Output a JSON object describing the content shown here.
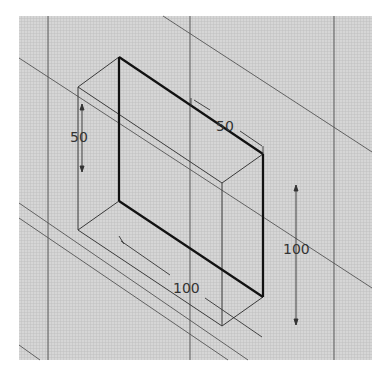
{
  "drawing": {
    "background": "#ffffff",
    "grid_area": {
      "x": 19,
      "y": 16,
      "width": 353,
      "height": 344,
      "fill": "#d2d2d2",
      "grid_color": "#bdbdbd",
      "grid_step": 3
    },
    "colors": {
      "thick": "#111111",
      "thin": "#3a3a3a",
      "construction": "#555555",
      "dimension": "#333333"
    },
    "dimensions": {
      "height_left": "50",
      "top_width": "50",
      "right_height": "100",
      "bottom_length": "100"
    }
  }
}
